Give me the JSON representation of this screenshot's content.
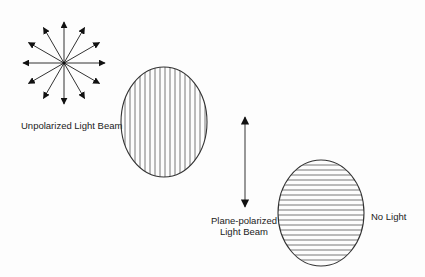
{
  "diagram": {
    "colors": {
      "ink": "#222222",
      "line": "#555555",
      "background": "#fdfdfd"
    },
    "unpolarized": {
      "label": "Unpolarized Light Beam",
      "icon": "starburst-arrows-icon",
      "arrow_count": 12
    },
    "polarizer_vertical": {
      "icon": "vertical-hatched-ellipse-icon",
      "hatch": "vertical"
    },
    "plane_polarized": {
      "label_line1": "Plane-polarized",
      "label_line2": "Light Beam",
      "icon": "double-headed-vertical-arrow-icon"
    },
    "polarizer_horizontal": {
      "icon": "horizontal-hatched-ellipse-icon",
      "hatch": "horizontal"
    },
    "result": {
      "label": "No Light"
    }
  }
}
